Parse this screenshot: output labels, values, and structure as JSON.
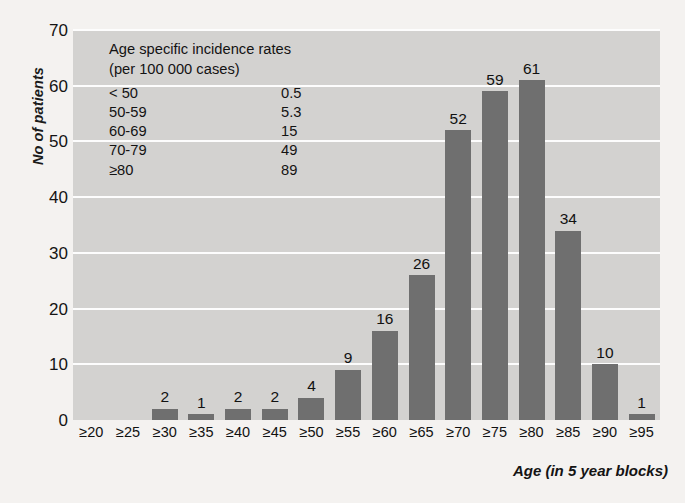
{
  "chart_data": {
    "type": "bar",
    "title": "",
    "xlabel": "Age (in 5 year blocks)",
    "ylabel": "No of patients",
    "ylim": [
      0,
      70
    ],
    "yticks": [
      0,
      10,
      20,
      30,
      40,
      50,
      60,
      70
    ],
    "grid": true,
    "legend_position": "inside-top-left",
    "categories": [
      "≥20",
      "≥25",
      "≥30",
      "≥35",
      "≥40",
      "≥45",
      "≥50",
      "≥55",
      "≥60",
      "≥65",
      "≥70",
      "≥75",
      "≥80",
      "≥85",
      "≥90",
      "≥95"
    ],
    "values": [
      0,
      0,
      2,
      1,
      2,
      2,
      4,
      9,
      16,
      26,
      52,
      59,
      61,
      34,
      10,
      1
    ],
    "bar_labels": [
      "",
      "",
      "2",
      "1",
      "2",
      "2",
      "4",
      "9",
      "16",
      "26",
      "52",
      "59",
      "61",
      "34",
      "10",
      "1"
    ],
    "colors": {
      "bar": "#6f6f6f",
      "plot_background": "#d3d2d0",
      "page_background": "#f4f2f0",
      "gridline": "#fdfdfd",
      "text": "#131313"
    },
    "annotation": {
      "title_line1": "Age specific incidence rates",
      "title_line2": "(per 100 000 cases)",
      "rows": [
        {
          "range": "< 50",
          "rate": "0.5"
        },
        {
          "range": "50-59",
          "rate": "5.3"
        },
        {
          "range": "60-69",
          "rate": "15"
        },
        {
          "range": "70-79",
          "rate": "49"
        },
        {
          "range": "≥80",
          "rate": "89"
        }
      ]
    }
  }
}
